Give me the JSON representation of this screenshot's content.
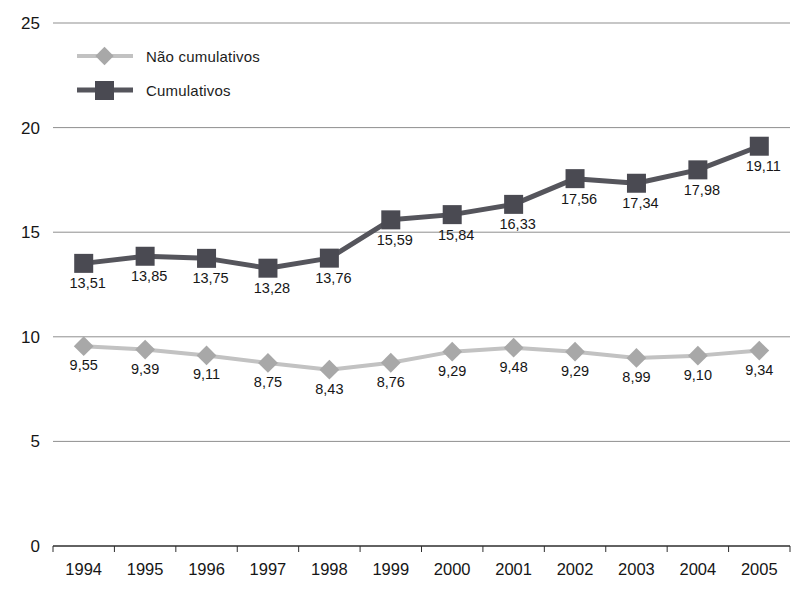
{
  "chart_data": {
    "type": "line",
    "title": "",
    "xlabel": "",
    "ylabel": "",
    "categories": [
      "1994",
      "1995",
      "1996",
      "1997",
      "1998",
      "1999",
      "2000",
      "2001",
      "2002",
      "2003",
      "2004",
      "2005"
    ],
    "series": [
      {
        "name": "Não cumulativos",
        "marker": "diamond",
        "line_color": "#c2c2c2",
        "marker_color": "#a8a8a8",
        "values": [
          9.55,
          9.39,
          9.11,
          8.75,
          8.43,
          8.76,
          9.29,
          9.48,
          9.29,
          8.99,
          9.1,
          9.34
        ],
        "labels": [
          "9,55",
          "9,39",
          "9,11",
          "8,75",
          "8,43",
          "8,76",
          "9,29",
          "9,48",
          "9,29",
          "8,99",
          "9,10",
          "9,34"
        ]
      },
      {
        "name": "Cumulativos",
        "marker": "square",
        "line_color": "#55555c",
        "marker_color": "#4a4a52",
        "values": [
          13.51,
          13.85,
          13.75,
          13.28,
          13.76,
          15.59,
          15.84,
          16.33,
          17.56,
          17.34,
          17.98,
          19.11
        ],
        "labels": [
          "13,51",
          "13,85",
          "13,75",
          "13,28",
          "13,76",
          "15,59",
          "15,84",
          "16,33",
          "17,56",
          "17,34",
          "17,98",
          "19,11"
        ]
      }
    ],
    "ylim": [
      0,
      25
    ],
    "yticks": [
      0,
      5,
      10,
      15,
      20,
      25
    ],
    "grid": true,
    "legend_position": "top-left",
    "decimal_separator": ",",
    "gridline_color": "#8f8f8f",
    "axis_color": "#2e2e2e",
    "label_color": "#161616"
  }
}
